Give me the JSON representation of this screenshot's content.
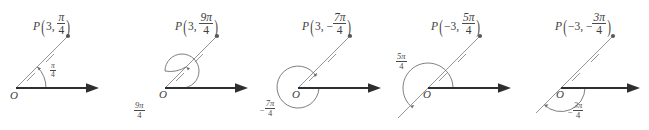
{
  "diagram": {
    "background_color": "#ffffff",
    "ink_color": "#4a4a4a",
    "axis_color": "#333333",
    "point_color": "#555555",
    "figure_count": 5
  },
  "figures": [
    {
      "id": "figure-1",
      "point_label": {
        "name": "P",
        "r": "3",
        "r_sign": "",
        "theta_sign": "",
        "theta_numerator": "π",
        "theta_denominator": "4",
        "full_text": "P(3, π/4)"
      },
      "origin_label": "O",
      "angle_label": {
        "sign": "",
        "numerator": "π",
        "denominator": "4",
        "full_text": "π/4",
        "position": "inside-angle"
      },
      "angle_degrees": 45,
      "has_full_loop": false,
      "has_negative_ray": false,
      "tick_count": 2,
      "arc_direction": "counterclockwise"
    },
    {
      "id": "figure-2",
      "point_label": {
        "name": "P",
        "r": "3",
        "r_sign": "",
        "theta_sign": "",
        "theta_numerator": "9π",
        "theta_denominator": "4",
        "full_text": "P(3, 9π/4)"
      },
      "origin_label": "O",
      "angle_label": {
        "sign": "",
        "numerator": "9π",
        "denominator": "4",
        "full_text": "9π/4",
        "position": "below-left"
      },
      "angle_degrees": 405,
      "has_full_loop": true,
      "has_negative_ray": false,
      "tick_count": 2,
      "arc_direction": "counterclockwise"
    },
    {
      "id": "figure-3",
      "point_label": {
        "name": "P",
        "r": "3",
        "r_sign": "",
        "theta_sign": "−",
        "theta_numerator": "7π",
        "theta_denominator": "4",
        "full_text": "P(3, −7π/4)"
      },
      "origin_label": "O",
      "angle_label": {
        "sign": "−",
        "numerator": "7π",
        "denominator": "4",
        "full_text": "−7π/4",
        "position": "below-left"
      },
      "angle_degrees": -315,
      "has_full_loop": false,
      "has_negative_ray": false,
      "tick_count": 2,
      "arc_direction": "clockwise"
    },
    {
      "id": "figure-4",
      "point_label": {
        "name": "P",
        "r": "3",
        "r_sign": "−",
        "theta_sign": "",
        "theta_numerator": "5π",
        "theta_denominator": "4",
        "full_text": "P(−3, 5π/4)"
      },
      "origin_label": "O",
      "angle_label": {
        "sign": "",
        "numerator": "5π",
        "denominator": "4",
        "full_text": "5π/4",
        "position": "upper-left"
      },
      "angle_degrees": 225,
      "has_full_loop": false,
      "has_negative_ray": true,
      "tick_count": 2,
      "arc_direction": "counterclockwise"
    },
    {
      "id": "figure-5",
      "point_label": {
        "name": "P",
        "r": "3",
        "r_sign": "−",
        "theta_sign": "−",
        "theta_numerator": "3π",
        "theta_denominator": "4",
        "full_text": "P(−3, −3π/4)"
      },
      "origin_label": "O",
      "angle_label": {
        "sign": "−",
        "numerator": "3π",
        "denominator": "4",
        "full_text": "−3π/4",
        "position": "below-right"
      },
      "angle_degrees": -135,
      "has_full_loop": false,
      "has_negative_ray": true,
      "tick_count": 2,
      "arc_direction": "clockwise"
    }
  ]
}
